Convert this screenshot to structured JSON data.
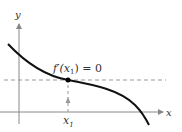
{
  "diagram": {
    "axis_labels": {
      "x": "x",
      "y": "y"
    },
    "point_label": "f′(x",
    "point_label_sub": "1",
    "point_label_tail": ") = 0",
    "x_tick_label": "x",
    "x_tick_sub": "1",
    "colors": {
      "curve": "#111111",
      "axis": "#888888",
      "dashed": "#999999",
      "point": "#000000"
    }
  }
}
